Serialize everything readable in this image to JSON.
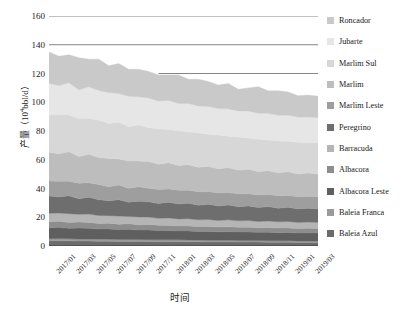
{
  "chart_data": {
    "type": "area",
    "stacked": true,
    "title": "",
    "xlabel": "时间",
    "ylabel": "产量（10⁴bbl/d）",
    "ylim": [
      0,
      160
    ],
    "yticks": [
      0,
      20,
      40,
      60,
      80,
      100,
      120,
      140,
      160
    ],
    "grid": "horizontal-partial",
    "legend_position": "right",
    "x": [
      "2017/01",
      "2017/02",
      "2017/03",
      "2017/04",
      "2017/05",
      "2017/06",
      "2017/07",
      "2017/08",
      "2017/09",
      "2017/10",
      "2017/11",
      "2017/12",
      "2018/01",
      "2018/02",
      "2018/03",
      "2018/04",
      "2018/05",
      "2018/06",
      "2018/07",
      "2018/08",
      "2018/09",
      "2018/10",
      "2018/11",
      "2018/12",
      "2019/01",
      "2019/02",
      "2019/03",
      "2019/04"
    ],
    "xtick_labels": [
      "2017/01",
      "2017/03",
      "2017/05",
      "2017/07",
      "2017/09",
      "2017/11",
      "2018/01",
      "2018/03",
      "2018/05",
      "2018/07",
      "2018/09",
      "2018/11",
      "2019/01",
      "2019/03"
    ],
    "series": [
      {
        "name": "Baleia Azul",
        "color": "#6b6b6b",
        "values": [
          3.5,
          3.6,
          3.6,
          3.4,
          3.4,
          3.3,
          3.3,
          3.2,
          3.2,
          3.1,
          3.1,
          3.0,
          3.0,
          3.0,
          2.9,
          2.9,
          2.8,
          2.8,
          2.8,
          2.7,
          2.7,
          2.7,
          2.6,
          2.6,
          2.6,
          2.5,
          2.5,
          2.5
        ]
      },
      {
        "name": "Baleia Franca",
        "color": "#9a9a9a",
        "values": [
          1.6,
          1.6,
          1.5,
          1.5,
          1.5,
          1.5,
          1.4,
          1.4,
          1.4,
          1.4,
          1.3,
          1.3,
          1.3,
          1.3,
          1.3,
          1.2,
          1.2,
          1.2,
          1.2,
          1.2,
          1.1,
          1.1,
          1.1,
          1.1,
          1.1,
          1.0,
          1.0,
          1.0
        ]
      },
      {
        "name": "Albacora Leste",
        "color": "#5f5f5f",
        "values": [
          7.5,
          7.8,
          7.2,
          7.6,
          7.4,
          7.0,
          7.2,
          6.8,
          7.0,
          6.6,
          6.8,
          6.5,
          6.4,
          6.2,
          6.3,
          6.0,
          6.1,
          5.9,
          6.0,
          5.8,
          5.9,
          5.7,
          5.8,
          5.6,
          5.7,
          5.5,
          5.6,
          5.5
        ]
      },
      {
        "name": "Albacora",
        "color": "#8d8d8d",
        "values": [
          4.2,
          4.3,
          4.0,
          4.2,
          4.1,
          3.9,
          4.0,
          3.8,
          3.9,
          3.7,
          3.8,
          3.6,
          3.6,
          3.5,
          3.5,
          3.4,
          3.4,
          3.3,
          3.4,
          3.3,
          3.3,
          3.2,
          3.3,
          3.2,
          3.2,
          3.1,
          3.2,
          3.1
        ]
      },
      {
        "name": "Barracuda",
        "color": "#b5b5b5",
        "values": [
          6.0,
          5.6,
          6.2,
          5.4,
          5.8,
          5.5,
          5.2,
          5.6,
          5.0,
          5.4,
          5.1,
          4.9,
          5.2,
          4.8,
          5.0,
          4.7,
          4.9,
          4.6,
          4.8,
          4.5,
          4.7,
          4.4,
          4.6,
          4.3,
          4.5,
          4.3,
          4.4,
          4.3
        ]
      },
      {
        "name": "Peregrino",
        "color": "#6e6e6e",
        "values": [
          12.0,
          11.2,
          12.4,
          10.8,
          11.8,
          11.0,
          10.4,
          11.4,
          10.0,
          11.0,
          10.6,
          10.2,
          11.0,
          10.4,
          10.8,
          10.2,
          10.6,
          10.0,
          10.4,
          9.8,
          10.2,
          9.6,
          10.0,
          9.5,
          9.8,
          9.4,
          9.6,
          9.4
        ]
      },
      {
        "name": "Marlim Leste",
        "color": "#9e9e9e",
        "values": [
          10.5,
          11.0,
          10.2,
          10.8,
          10.0,
          10.5,
          9.8,
          10.2,
          9.6,
          10.0,
          9.4,
          9.8,
          9.2,
          9.6,
          9.0,
          9.4,
          8.8,
          9.2,
          8.6,
          9.0,
          8.5,
          8.8,
          8.4,
          8.6,
          8.3,
          8.5,
          8.2,
          8.4
        ]
      },
      {
        "name": "Marlim",
        "color": "#bdbdbd",
        "values": [
          20.0,
          19.0,
          20.5,
          18.5,
          19.8,
          18.8,
          19.5,
          18.2,
          19.0,
          18.0,
          18.6,
          17.6,
          18.2,
          17.2,
          17.8,
          17.0,
          17.5,
          16.8,
          17.2,
          16.5,
          17.0,
          16.2,
          16.6,
          16.0,
          16.4,
          15.8,
          16.2,
          15.8
        ]
      },
      {
        "name": "Marlim Sul",
        "color": "#d7d7d7",
        "values": [
          26.0,
          27.0,
          25.5,
          26.5,
          25.0,
          26.0,
          24.5,
          25.5,
          24.0,
          25.0,
          23.6,
          24.6,
          23.2,
          24.2,
          22.8,
          23.8,
          22.4,
          23.4,
          22.0,
          23.0,
          21.8,
          22.6,
          21.4,
          22.2,
          21.2,
          22.0,
          21.0,
          21.8
        ]
      },
      {
        "name": "Jubarte",
        "color": "#e6e6e6",
        "values": [
          22.0,
          20.5,
          22.5,
          20.0,
          22.0,
          20.6,
          21.5,
          20.0,
          21.0,
          19.6,
          20.6,
          19.4,
          20.2,
          19.0,
          19.8,
          18.8,
          19.4,
          18.4,
          19.0,
          18.2,
          18.8,
          18.0,
          18.5,
          17.8,
          18.2,
          17.6,
          18.0,
          17.6
        ]
      },
      {
        "name": "Roncador",
        "color": "#c9c9c9",
        "values": [
          21.7,
          20.4,
          19.4,
          22.3,
          19.2,
          21.9,
          18.6,
          20.9,
          18.9,
          19.2,
          18.5,
          18.1,
          17.7,
          19.8,
          16.8,
          18.6,
          17.3,
          16.4,
          17.6,
          15.0,
          16.0,
          18.5,
          15.7,
          17.1,
          16.2,
          14.9,
          15.3,
          14.8
        ]
      }
    ]
  },
  "legend": {
    "items": [
      {
        "label": "Roncador",
        "color": "#c9c9c9"
      },
      {
        "label": "Jubarte",
        "color": "#e6e6e6"
      },
      {
        "label": "Marlim Sul",
        "color": "#d7d7d7"
      },
      {
        "label": "Marlim",
        "color": "#bdbdbd"
      },
      {
        "label": "Marlim Leste",
        "color": "#9e9e9e"
      },
      {
        "label": "Peregrino",
        "color": "#6e6e6e"
      },
      {
        "label": "Barracuda",
        "color": "#b5b5b5"
      },
      {
        "label": "Albacora",
        "color": "#8d8d8d"
      },
      {
        "label": "Albacora Leste",
        "color": "#5f5f5f"
      },
      {
        "label": "Baleia Franca",
        "color": "#9a9a9a"
      },
      {
        "label": "Baleia Azul",
        "color": "#6b6b6b"
      }
    ]
  },
  "axes": {
    "y_title_main": "产量",
    "y_title_unit": "（10",
    "y_title_exp": "4",
    "y_title_unit2": "bbl/d）",
    "x_title": "时间"
  }
}
